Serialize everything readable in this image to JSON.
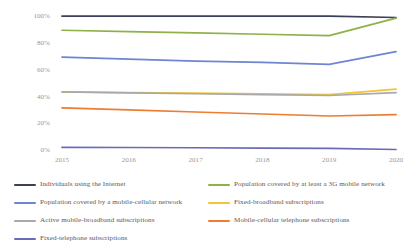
{
  "chart_data": {
    "type": "line",
    "title": "",
    "xlabel": "",
    "ylabel": "",
    "x": [
      "2015",
      "2016",
      "2017",
      "2018",
      "2019",
      "2020"
    ],
    "categories": [
      "2015",
      "2016",
      "2017",
      "2018",
      "2019",
      "2020"
    ],
    "ylim": [
      0,
      100
    ],
    "yticks": [
      0,
      20,
      40,
      60,
      80,
      100
    ],
    "ytick_labels": [
      "0%",
      "20%",
      "40%",
      "60%",
      "80%",
      "100%"
    ],
    "grid": false,
    "legend_position": "bottom",
    "series": [
      {
        "name": "Individuals using the Internet",
        "color": "#3c3f58",
        "values": [
          99.5,
          99.5,
          99.5,
          99.5,
          99.5,
          98.5
        ]
      },
      {
        "name": "Population covered by at least a 3G mobile network",
        "color": "#8eb14a",
        "values": [
          89.0,
          88.0,
          87.0,
          86.0,
          85.0,
          98.0
        ]
      },
      {
        "name": "Population covered by a mobile-cellular network",
        "color": "#6d85d3",
        "values": [
          69.0,
          67.5,
          66.0,
          65.0,
          63.5,
          73.0
        ]
      },
      {
        "name": "Fixed-broadband subscriptions",
        "color": "#f2c438",
        "values": [
          43.0,
          42.5,
          42.0,
          41.5,
          41.0,
          45.0
        ]
      },
      {
        "name": "Active mobile-broadband subscriptions",
        "color": "#a7a9ac",
        "values": [
          43.0,
          42.3,
          41.6,
          41.0,
          40.3,
          42.5
        ]
      },
      {
        "name": "Mobile-cellular telephone subscriptions",
        "color": "#ed7d31",
        "values": [
          31.0,
          29.5,
          28.0,
          26.5,
          25.0,
          26.0
        ]
      },
      {
        "name": "Fixed-telephone subscriptions",
        "color": "#6a6ab8",
        "values": [
          1.6,
          1.5,
          1.3,
          1.1,
          0.8,
          0.0
        ]
      }
    ]
  },
  "axis": {
    "y_labels": [
      "100%",
      "80%",
      "60%",
      "40%",
      "20%",
      "0%"
    ],
    "x_labels": [
      "2015",
      "2016",
      "2017",
      "2018",
      "2019",
      "2020"
    ]
  },
  "legend": {
    "left": [
      {
        "label": "Individuals using the Internet",
        "color": "#3c3f58"
      },
      {
        "label": "Population covered by a mobile-cellular network",
        "color": "#6d85d3"
      },
      {
        "label": "Active mobile-broadband subscriptions",
        "color": "#a7a9ac"
      },
      {
        "label": "Fixed-telephone subscriptions",
        "color": "#6a6ab8"
      }
    ],
    "right": [
      {
        "label": "Population covered by at least a 3G mobile network",
        "color": "#8eb14a"
      },
      {
        "label": "Fixed-broadband subscriptions",
        "color": "#f2c438"
      },
      {
        "label": "Mobile-cellular telephone subscriptions",
        "color": "#ed7d31"
      }
    ]
  }
}
